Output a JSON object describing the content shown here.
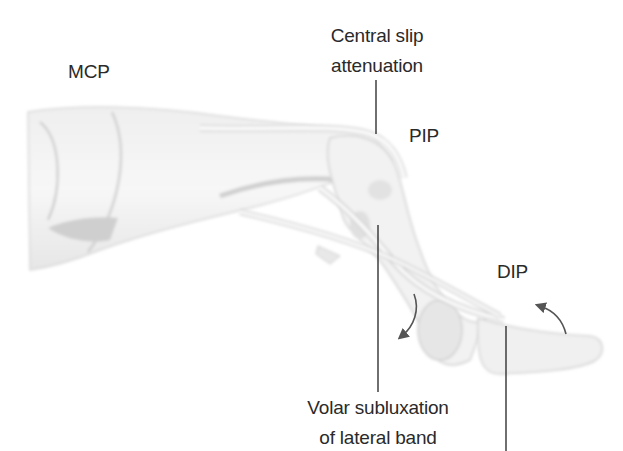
{
  "figure": {
    "colors": {
      "background": "#ffffff",
      "text": "#2a2a2a",
      "leader_line": "#222222",
      "arrow": "#555555",
      "bone_fill": "#f1f1f1",
      "bone_shade": "#c9c9c9",
      "tendon": "#fafafa"
    }
  },
  "labels": {
    "mcp": "MCP",
    "pip": "PIP",
    "dip": "DIP",
    "central_slip": {
      "line1": "Central slip",
      "line2": "attenuation"
    },
    "volar_subluxation": {
      "line1": "Volar subluxation",
      "line2": "of lateral band"
    },
    "terminal_tendon": {
      "line1": "Terminal",
      "line2": "tendon"
    }
  },
  "arrows": [
    {
      "name": "pip-flexion-arrow",
      "direction": "down-left"
    },
    {
      "name": "dip-hyperextension-arrow",
      "direction": "up-left"
    }
  ]
}
